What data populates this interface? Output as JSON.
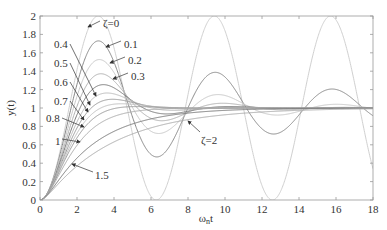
{
  "chart_data": {
    "type": "line",
    "title": "",
    "xlabel": "ωnt",
    "ylabel": "y(t)",
    "xlim": [
      0,
      18
    ],
    "ylim": [
      0,
      2
    ],
    "grid": false,
    "legend_position": "none (inline annotations with arrows)",
    "x_ticks": [
      "0",
      "2",
      "4",
      "6",
      "8",
      "10",
      "12",
      "14",
      "16",
      "18"
    ],
    "y_ticks": [
      "0",
      "0.2",
      "0.4",
      "0.6",
      "0.8",
      "1",
      "1.2",
      "1.4",
      "1.6",
      "1.8",
      "2"
    ],
    "series": [
      {
        "name": "ζ=0",
        "zeta": 0,
        "peak": 2.0,
        "peak_x": 3.14,
        "color": "#d0d0d0"
      },
      {
        "name": "0.1",
        "zeta": 0.1,
        "peak": 1.73,
        "peak_x": 3.16,
        "color": "#888888"
      },
      {
        "name": "0.2",
        "zeta": 0.2,
        "peak": 1.53,
        "peak_x": 3.21,
        "color": "#c8c8c8"
      },
      {
        "name": "0.3",
        "zeta": 0.3,
        "peak": 1.37,
        "peak_x": 3.29,
        "color": "#b0b0b0"
      },
      {
        "name": "0.4",
        "zeta": 0.4,
        "peak": 1.25,
        "peak_x": 3.43,
        "color": "#777777"
      },
      {
        "name": "0.5",
        "zeta": 0.5,
        "peak": 1.16,
        "peak_x": 3.63,
        "color": "#bbbbbb"
      },
      {
        "name": "0.6",
        "zeta": 0.6,
        "peak": 1.09,
        "peak_x": 3.93,
        "color": "#999999"
      },
      {
        "name": "0.7",
        "zeta": 0.7,
        "peak": 1.05,
        "peak_x": 4.4,
        "color": "#c0c0c0"
      },
      {
        "name": "0.8",
        "zeta": 0.8,
        "peak": 1.02,
        "peak_x": 5.24,
        "color": "#999999"
      },
      {
        "name": "1",
        "zeta": 1.0,
        "peak": 1.0,
        "peak_x": 18,
        "color": "#aaaaaa"
      },
      {
        "name": "1.5",
        "zeta": 1.5,
        "peak": 1.0,
        "peak_x": 18,
        "color": "#777777"
      },
      {
        "name": "ζ=2",
        "zeta": 2.0,
        "peak": 1.0,
        "peak_x": 18,
        "color": "#aaaaaa"
      }
    ],
    "annotations": [
      {
        "text": "ζ=0",
        "x_px": 103,
        "y_px": 23
      },
      {
        "text": "0.1",
        "x_px": 124,
        "y_px": 44
      },
      {
        "text": "0.2",
        "x_px": 128,
        "y_px": 60
      },
      {
        "text": "0.3",
        "x_px": 131,
        "y_px": 76
      },
      {
        "text": "0.4",
        "x_px": 54,
        "y_px": 44
      },
      {
        "text": "0.5",
        "x_px": 54,
        "y_px": 63
      },
      {
        "text": "0.6",
        "x_px": 54,
        "y_px": 82
      },
      {
        "text": "0.7",
        "x_px": 54,
        "y_px": 101
      },
      {
        "text": "0.8",
        "x_px": 46,
        "y_px": 118
      },
      {
        "text": "1",
        "x_px": 55,
        "y_px": 141
      },
      {
        "text": "1.5",
        "x_px": 95,
        "y_px": 175
      },
      {
        "text": "ζ=2",
        "x_px": 201,
        "y_px": 140
      }
    ]
  }
}
